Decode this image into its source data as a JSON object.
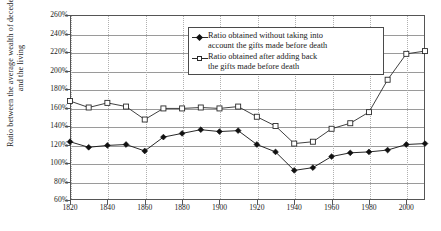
{
  "chart_data": {
    "type": "line",
    "title": "",
    "xlabel": "",
    "ylabel": "Ratio between the average wealth of decedents and the living",
    "x": [
      1820,
      1830,
      1840,
      1850,
      1860,
      1870,
      1880,
      1890,
      1900,
      1910,
      1920,
      1930,
      1940,
      1950,
      1960,
      1970,
      1980,
      1990,
      2000,
      2010
    ],
    "xlim": [
      1820,
      2010
    ],
    "ylim": [
      60,
      260
    ],
    "xticks": [
      1820,
      1840,
      1860,
      1880,
      1900,
      1920,
      1940,
      1960,
      1980,
      2000
    ],
    "xticklabels": [
      "1820",
      "1840",
      "1860",
      "1880",
      "1900",
      "1920",
      "1940",
      "1960",
      "1980",
      "2000"
    ],
    "yticks": [
      60,
      80,
      100,
      120,
      140,
      160,
      180,
      200,
      220,
      240,
      260
    ],
    "yticklabels": [
      "60%",
      "80%",
      "100%",
      "120%",
      "140%",
      "160%",
      "180%",
      "200%",
      "220%",
      "240%",
      "260%"
    ],
    "grid": "horizontal-solid-and-vertical-dotted",
    "legend_position": "upper-center",
    "series": [
      {
        "name": "Ratio obtained without taking into account the gifts made before death",
        "marker": "filled-diamond",
        "color": "#111111",
        "values": [
          123,
          117,
          119,
          120,
          113,
          128,
          132,
          136,
          134,
          135,
          120,
          112,
          92,
          95,
          107,
          111,
          112,
          114,
          120,
          121
        ]
      },
      {
        "name": "Ratio obtained after adding back the gifts made before death",
        "marker": "open-square",
        "color": "#2a2a2a",
        "values": [
          167,
          160,
          165,
          161,
          147,
          159,
          159,
          160,
          159,
          161,
          150,
          140,
          121,
          123,
          137,
          143,
          155,
          190,
          218,
          221
        ]
      }
    ]
  },
  "legend": {
    "entries": [
      {
        "label_line1": "Ratio obtained without taking into",
        "label_line2": "account the gifts made before death",
        "marker": "filled-diamond"
      },
      {
        "label_line1": "Ratio obtained after adding back",
        "label_line2": "the gifts made before death",
        "marker": "open-square"
      }
    ]
  },
  "axis": {
    "y_title": "Ratio between the average wealth of decedents and the living"
  }
}
